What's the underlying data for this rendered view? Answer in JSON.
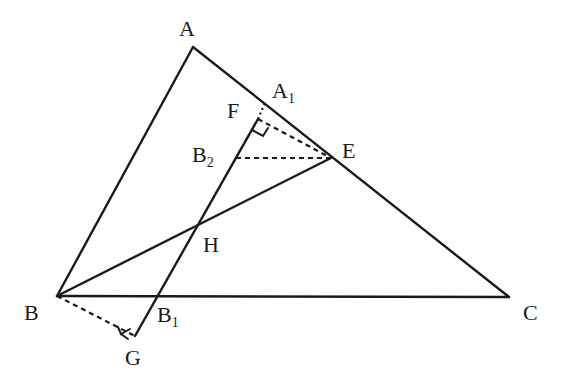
{
  "diagram": {
    "points": {
      "A": {
        "label": "A",
        "x": 193,
        "y": 47
      },
      "B": {
        "label": "B",
        "x": 57,
        "y": 296
      },
      "C": {
        "label": "C",
        "x": 509,
        "y": 297
      },
      "E": {
        "label": "E",
        "x": 331,
        "y": 158
      },
      "H": {
        "label": "H",
        "x": 196,
        "y": 228
      },
      "F": {
        "label": "F",
        "x": 258,
        "y": 119
      },
      "A1": {
        "label": "A",
        "sub": "1",
        "x": 265,
        "y": 103
      },
      "B1": {
        "label": "B",
        "sub": "1",
        "x": 157,
        "y": 296
      },
      "B2": {
        "label": "B",
        "sub": "2",
        "x": 236,
        "y": 158
      },
      "G": {
        "label": "G",
        "x": 135,
        "y": 336
      }
    },
    "segments_solid": [
      "AB",
      "AC",
      "BC",
      "BE",
      "GF"
    ],
    "segments_dashed": [
      "BG",
      "FE",
      "B2E"
    ],
    "segments_dotted": [
      "FA1"
    ],
    "right_angles": [
      "G",
      "F"
    ]
  }
}
